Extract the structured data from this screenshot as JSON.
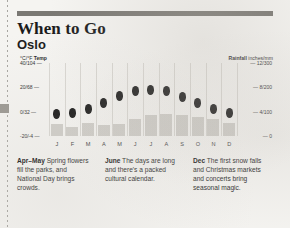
{
  "header": {
    "title": "When to Go",
    "subtitle": "Oslo"
  },
  "chart_data": {
    "type": "bar",
    "categories": [
      "J",
      "F",
      "M",
      "A",
      "M",
      "J",
      "J",
      "A",
      "S",
      "O",
      "N",
      "D"
    ],
    "left_axis": {
      "caption_unit": "°C/°F",
      "caption_label": "Temp",
      "ticks": [
        "40/104",
        "20/68",
        "0/32",
        "-20/-4"
      ],
      "tick_values": [
        40,
        20,
        0,
        -20
      ],
      "ylim": [
        -20,
        40
      ]
    },
    "right_axis": {
      "caption_label": "Rainfall",
      "caption_unit": "inches/mm",
      "ticks": [
        "12/300",
        "8/200",
        "4/100",
        "0"
      ],
      "tick_values": [
        12,
        8,
        4,
        0
      ],
      "ylim": [
        0,
        12
      ]
    },
    "series": [
      {
        "name": "Temp",
        "unit": "°C",
        "axis": "left",
        "marker": "dot",
        "values": [
          -2,
          -1,
          2,
          7,
          13,
          17,
          18,
          17,
          12,
          7,
          2,
          -1
        ]
      },
      {
        "name": "Rainfall",
        "unit": "inches",
        "axis": "right",
        "marker": "bar",
        "values": [
          1.9,
          1.5,
          2.1,
          1.8,
          2.0,
          2.8,
          3.5,
          3.6,
          3.4,
          3.1,
          2.8,
          2.2
        ]
      }
    ],
    "grid": false,
    "legend": "none"
  },
  "notes": [
    {
      "label": "Apr–May",
      "text": " Spring flowers fill the parks, and National Day brings crowds."
    },
    {
      "label": "June",
      "text": " The days are long and there's a packed cultural calendar."
    },
    {
      "label": "Dec",
      "text": " The first snow falls and Christmas markets and concerts bring seasonal magic."
    }
  ],
  "colors": {
    "page": "#f5f4f1",
    "rule": "#7a7873",
    "bar": "#cfcdc8",
    "dot": "#161616",
    "text": "#1b1b1b"
  }
}
